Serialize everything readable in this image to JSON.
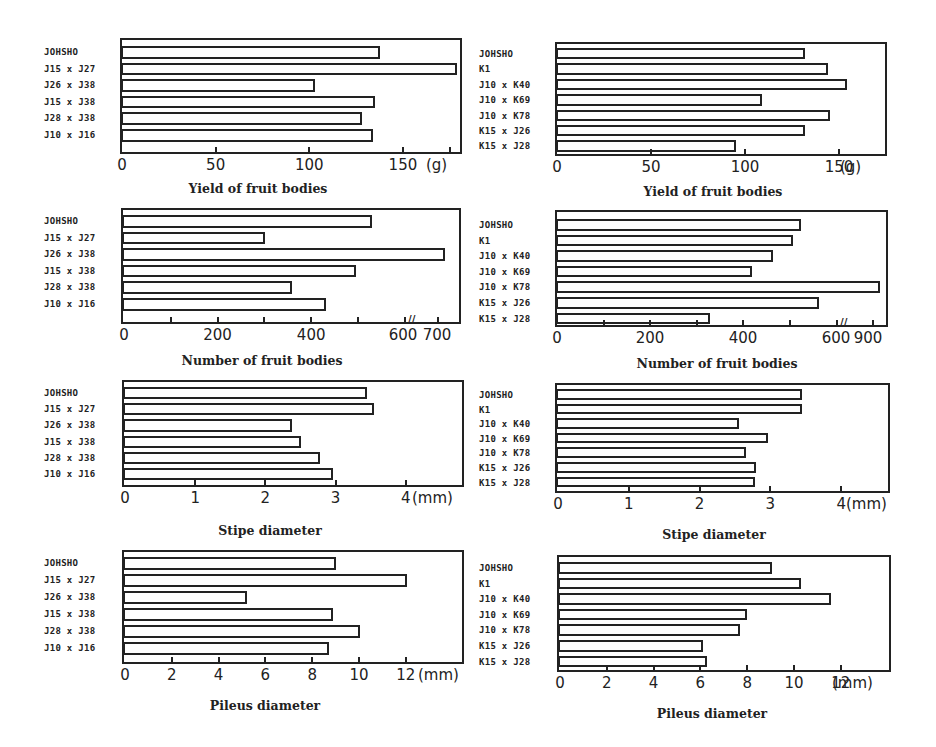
{
  "chart_data": [
    {
      "id": "yield-left",
      "type": "bar",
      "orientation": "horizontal",
      "categories": [
        "JOHSHO",
        "J15 x J27",
        "J26 x J38",
        "J15 x J38",
        "J28 x J38",
        "J10 x J16"
      ],
      "values": [
        138,
        179,
        103,
        135,
        128,
        134
      ],
      "xlabel": "Yield of fruit bodies",
      "unit": "(g)",
      "xticks": [
        "0",
        "50",
        "100",
        "150"
      ],
      "xlim": [
        0,
        180
      ],
      "grid": false
    },
    {
      "id": "yield-right",
      "type": "bar",
      "orientation": "horizontal",
      "categories": [
        "JOHSHO",
        "K1",
        "J10 x K40",
        "J10 x K69",
        "J10 x K78",
        "K15 x J26",
        "K15 x J28"
      ],
      "values": [
        132,
        144,
        154,
        109,
        145,
        132,
        95
      ],
      "xlabel": "Yield of fruit bodies",
      "unit": "(g)",
      "xticks": [
        "0",
        "50",
        "100",
        "150"
      ],
      "xlim": [
        0,
        175
      ],
      "grid": false
    },
    {
      "id": "number-left",
      "type": "bar",
      "orientation": "horizontal",
      "categories": [
        "JOHSHO",
        "J15 x J27",
        "J26 x J38",
        "J15 x J38",
        "J28 x J38",
        "J10 x J16"
      ],
      "values": [
        530,
        302,
        700,
        495,
        360,
        432
      ],
      "xlabel": "Number of fruit bodies",
      "unit": "",
      "xticks": [
        "0",
        "200",
        "400",
        "600",
        "700"
      ],
      "axis_break": "between 600 and 700",
      "grid": false
    },
    {
      "id": "number-right",
      "type": "bar",
      "orientation": "horizontal",
      "categories": [
        "JOHSHO",
        "K1",
        "J10 x K40",
        "J10 x K69",
        "J10 x K78",
        "K15 x J26",
        "K15 x J28"
      ],
      "values": [
        525,
        507,
        465,
        420,
        900,
        563,
        328
      ],
      "xlabel": "Number of fruit bodies",
      "unit": "",
      "xticks": [
        "0",
        "200",
        "400",
        "600",
        "900"
      ],
      "axis_break": "between 600 and 900",
      "grid": false
    },
    {
      "id": "stipe-left",
      "type": "bar",
      "orientation": "horizontal",
      "categories": [
        "JOHSHO",
        "J15 x J27",
        "J26 x J38",
        "J15 x J38",
        "J28 x J38",
        "J10 x J16"
      ],
      "values": [
        3.45,
        3.55,
        2.38,
        2.5,
        2.78,
        2.97
      ],
      "xlabel": "Stipe diameter",
      "unit": "(mm)",
      "xticks": [
        "0",
        "1",
        "2",
        "3",
        "4"
      ],
      "xlim": [
        0,
        4.7
      ],
      "grid": false
    },
    {
      "id": "stipe-right",
      "type": "bar",
      "orientation": "horizontal",
      "categories": [
        "JOHSHO",
        "K1",
        "J10 x K40",
        "J10 x K69",
        "J10 x K78",
        "K15 x J26",
        "K15 x J28"
      ],
      "values": [
        3.45,
        3.45,
        2.56,
        2.96,
        2.65,
        2.8,
        2.78
      ],
      "xlabel": "Stipe diameter",
      "unit": "(mm)",
      "xticks": [
        "0",
        "1",
        "2",
        "3",
        "4"
      ],
      "xlim": [
        0,
        4.6
      ],
      "grid": false
    },
    {
      "id": "pileus-left",
      "type": "bar",
      "orientation": "horizontal",
      "categories": [
        "JOHSHO",
        "J15 x J27",
        "J26 x J38",
        "J15 x J38",
        "J28 x J38",
        "J10 x J16"
      ],
      "values": [
        9.0,
        12.05,
        5.2,
        8.9,
        10.05,
        8.7
      ],
      "xlabel": "Pileus diameter",
      "unit": "(mm)",
      "xticks": [
        "0",
        "2",
        "4",
        "6",
        "8",
        "10",
        "12"
      ],
      "xlim": [
        0,
        14
      ],
      "grid": false
    },
    {
      "id": "pileus-right",
      "type": "bar",
      "orientation": "horizontal",
      "categories": [
        "JOHSHO",
        "K1",
        "J10 x K40",
        "J10 x K69",
        "J10 x K78",
        "K15 x J26",
        "K15 x J28"
      ],
      "values": [
        9.05,
        10.3,
        11.6,
        8.0,
        7.7,
        6.1,
        6.3
      ],
      "xlabel": "Pileus diameter",
      "unit": "(mm)",
      "xticks": [
        "0",
        "2",
        "4",
        "6",
        "8",
        "10",
        "12"
      ],
      "xlim": [
        0,
        14
      ],
      "grid": false
    }
  ]
}
